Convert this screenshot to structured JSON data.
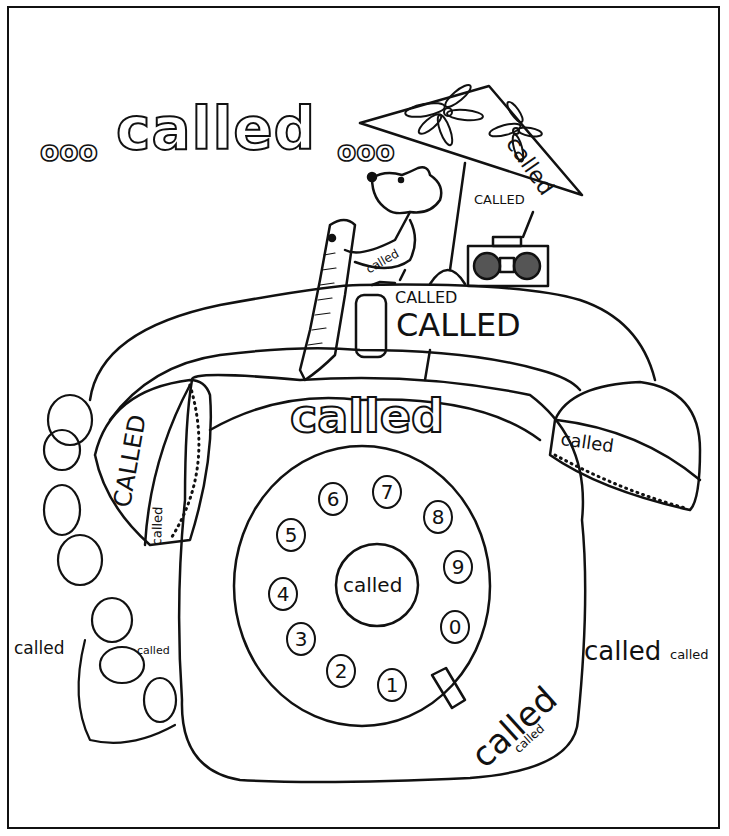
{
  "title": {
    "leading_dots": "ooo",
    "word": "called",
    "trailing_dots": "ooo"
  },
  "umbrella": {
    "label": "called"
  },
  "radio": {
    "label": "CALLED"
  },
  "dog": {
    "sash_label": "called"
  },
  "handset_top": {
    "small": "CALLED",
    "large": "CALLED"
  },
  "phone_body": {
    "outline_word": "called"
  },
  "left_earpiece": {
    "large": "CALLED",
    "small": "called"
  },
  "right_earpiece": {
    "label": "called"
  },
  "dial": {
    "center_label": "called",
    "digits": [
      "1",
      "2",
      "3",
      "4",
      "5",
      "6",
      "7",
      "8",
      "9",
      "0"
    ]
  },
  "bottom_right_on_phone": {
    "large": "called",
    "small": "called"
  },
  "right_margin": {
    "large": "called",
    "small": "called"
  },
  "left_cord": {
    "large": "called",
    "small": "called"
  },
  "colors": {
    "ink": "#111111",
    "paper": "#ffffff"
  }
}
